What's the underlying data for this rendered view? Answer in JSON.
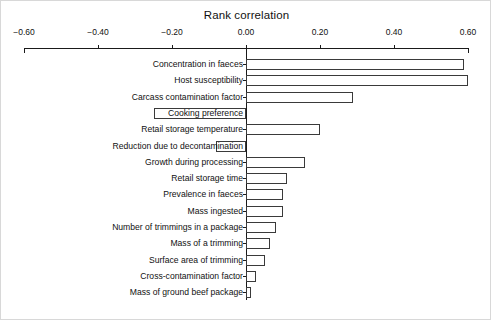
{
  "chart_data": {
    "type": "bar",
    "orientation": "horizontal",
    "title": "Rank correlation",
    "xlabel": "",
    "ylabel": "",
    "xlim": [
      -0.6,
      0.6
    ],
    "xticks": [
      -0.6,
      -0.4,
      -0.2,
      0.0,
      0.2,
      0.4,
      0.6
    ],
    "xtick_labels": [
      "−0.60",
      "−0.40",
      "−0.20",
      "0.00",
      "0.20",
      "0.40",
      "0.60"
    ],
    "grid": false,
    "legend": null,
    "categories": [
      "Concentration in faeces",
      "Host susceptibility",
      "Carcass contamination factor",
      "Cooking preference",
      "Retail storage temperature",
      "Reduction due to decontamination",
      "Growth during processing",
      "Retail storage time",
      "Prevalence in faeces",
      "Mass ingested",
      "Number of trimmings in a package",
      "Mass of a trimming",
      "Surface area of trimming",
      "Cross-contamination factor",
      "Mass of ground beef package"
    ],
    "values": [
      0.59,
      0.6,
      0.29,
      -0.25,
      0.2,
      -0.08,
      0.16,
      0.11,
      0.1,
      0.1,
      0.08,
      0.065,
      0.05,
      0.027,
      0.014
    ]
  }
}
